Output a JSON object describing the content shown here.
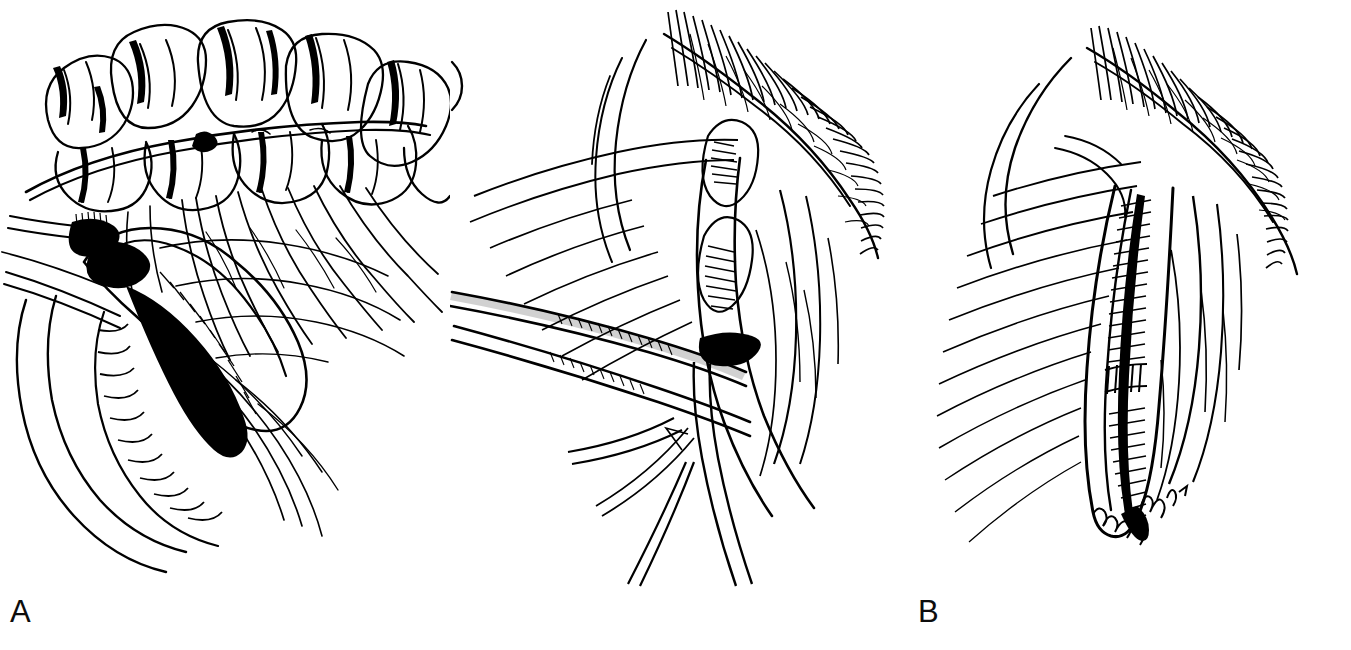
{
  "figure": {
    "type": "medical-surgical-line-art",
    "style": "pen-and-ink hatched illustration",
    "background_color": "#ffffff",
    "ink_color": "#000000",
    "panel_count": 3
  },
  "panels": [
    {
      "label": "A",
      "name": "panel-a",
      "caption": "",
      "content_description": "Haustrated bowel (colon) segment lifted above its fan-shaped mesentery showing arcade vessels; isolated loop with clamp at left and mesenteric pedicle descending to lower bowel loops"
    },
    {
      "label": "B",
      "name": "panel-b",
      "caption": "",
      "content_description": "Two long surgical clamps/retractors crossing the field, a tubular conduit being drawn through the tissue plane, with hatched cut tissue edge along the upper right margin"
    },
    {
      "label": "C",
      "name": "panel-c",
      "caption": "",
      "content_description": "Completed tubularized conduit lying in the tissue bed with a transverse interrupted suture / staple line across its midportion; artist signature at lower right"
    }
  ],
  "labels": {
    "a": "A",
    "b": "B",
    "c": "C"
  },
  "signature": {
    "present": true,
    "legible": false,
    "text": ""
  },
  "bottom_caption": {
    "visible": false,
    "text": ""
  }
}
